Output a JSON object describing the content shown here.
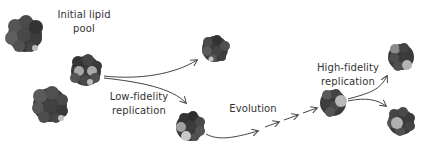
{
  "diagram": {
    "labels": {
      "initial_pool_line1": "Initial lipid",
      "initial_pool_line2": "pool",
      "low_fidelity_line1": "Low-fidelity",
      "low_fidelity_line2": "replication",
      "evolution": "Evolution",
      "high_fidelity_line1": "High-fidelity",
      "high_fidelity_line2": "replication"
    },
    "nodes": [
      {
        "id": "pool-cluster-1",
        "cx": 25,
        "cy": 35,
        "r": 17
      },
      {
        "id": "pool-cluster-2",
        "cx": 86,
        "cy": 71,
        "r": 15
      },
      {
        "id": "pool-cluster-3",
        "cx": 50,
        "cy": 105,
        "r": 17
      },
      {
        "id": "lowfi-offspring-top",
        "cx": 215,
        "cy": 49,
        "r": 13
      },
      {
        "id": "lowfi-offspring-bottom",
        "cx": 190,
        "cy": 127,
        "r": 14
      },
      {
        "id": "evolved-cluster",
        "cx": 333,
        "cy": 103,
        "r": 13
      },
      {
        "id": "hifi-offspring-top",
        "cx": 401,
        "cy": 57,
        "r": 13
      },
      {
        "id": "hifi-offspring-bottom",
        "cx": 401,
        "cy": 122,
        "r": 13
      }
    ],
    "colors": {
      "dark_lipid": "#3e3e3e",
      "mid_lipid": "#5a5a5a",
      "light_lipid": "#9a9a9a",
      "highlight_lipid": "#c8c8c8",
      "arrow": "#444444",
      "text": "#333333"
    }
  }
}
